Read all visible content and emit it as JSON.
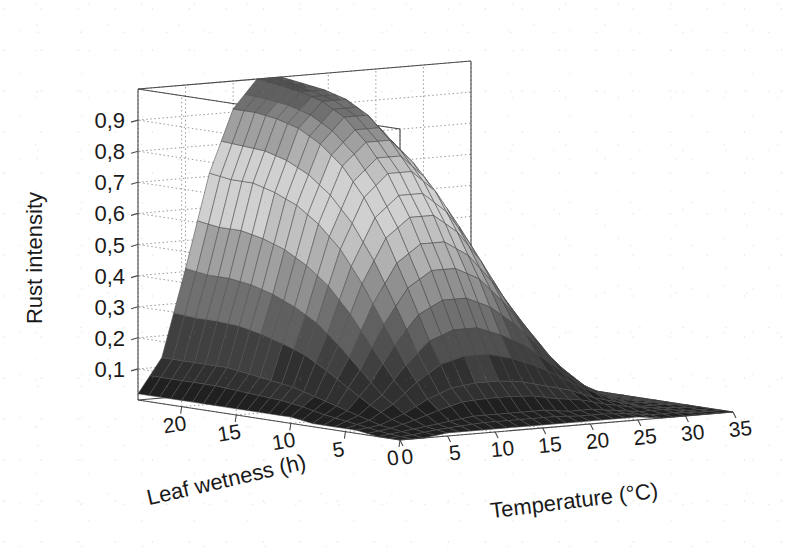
{
  "figure": {
    "kind": "3d-surface-plot",
    "background_color": "#ffffff",
    "grid_color": "#9a9a9a",
    "axis_line_color": "#4a4a4a",
    "mesh_edge_color": "#4c4c4c"
  },
  "axes": {
    "z": {
      "label": "Rust intensity",
      "ticks": [
        "0,1",
        "0,2",
        "0,3",
        "0,4",
        "0,5",
        "0,6",
        "0,7",
        "0,8",
        "0,9"
      ],
      "tick_values": [
        0.1,
        0.2,
        0.3,
        0.4,
        0.5,
        0.6,
        0.7,
        0.8,
        0.9
      ],
      "range": [
        0,
        1
      ],
      "decimal_separator": ","
    },
    "x": {
      "label": "Temperature (°C)",
      "ticks": [
        "0",
        "5",
        "10",
        "15",
        "20",
        "25",
        "30",
        "35"
      ],
      "tick_values": [
        0,
        5,
        10,
        15,
        20,
        25,
        30,
        35
      ],
      "range": [
        0,
        35
      ],
      "units": "°C"
    },
    "y": {
      "label": "Leaf wetness (h)",
      "ticks": [
        "0",
        "5",
        "10",
        "15",
        "20"
      ],
      "tick_values": [
        0,
        5,
        10,
        15,
        20
      ],
      "range": [
        0,
        24
      ],
      "units": "h"
    }
  },
  "chart_data": {
    "type": "heatmap",
    "render_as": "3d-surface",
    "title": "",
    "xlabel": "Temperature (°C)",
    "ylabel": "Leaf wetness (h)",
    "zlabel": "Rust intensity",
    "xlim": [
      0,
      35
    ],
    "ylim": [
      0,
      24
    ],
    "zlim": [
      0,
      1
    ],
    "grid": true,
    "legend": "none",
    "colormap": "grayscale",
    "x": [
      0,
      2.5,
      5,
      7.5,
      10,
      12.5,
      15,
      17.5,
      20,
      22.5,
      25,
      27.5,
      30,
      32.5,
      35
    ],
    "y": [
      0,
      2,
      4,
      6,
      8,
      10,
      12,
      14,
      16,
      18,
      20,
      22,
      24
    ],
    "z": [
      [
        0.0,
        0.0,
        0.01,
        0.01,
        0.01,
        0.01,
        0.01,
        0.01,
        0.01,
        0.01,
        0.01,
        0.0,
        0.0,
        0.0,
        0.0
      ],
      [
        0.0,
        0.01,
        0.02,
        0.03,
        0.04,
        0.04,
        0.04,
        0.04,
        0.03,
        0.03,
        0.02,
        0.01,
        0.01,
        0.0,
        0.0
      ],
      [
        0.01,
        0.02,
        0.05,
        0.09,
        0.12,
        0.13,
        0.13,
        0.12,
        0.1,
        0.08,
        0.05,
        0.03,
        0.01,
        0.01,
        0.0
      ],
      [
        0.01,
        0.04,
        0.1,
        0.19,
        0.26,
        0.29,
        0.29,
        0.26,
        0.22,
        0.16,
        0.1,
        0.05,
        0.02,
        0.01,
        0.0
      ],
      [
        0.01,
        0.06,
        0.17,
        0.31,
        0.42,
        0.47,
        0.47,
        0.43,
        0.35,
        0.26,
        0.16,
        0.08,
        0.03,
        0.01,
        0.0
      ],
      [
        0.02,
        0.08,
        0.24,
        0.43,
        0.57,
        0.63,
        0.63,
        0.57,
        0.47,
        0.34,
        0.21,
        0.1,
        0.04,
        0.01,
        0.0
      ],
      [
        0.02,
        0.1,
        0.3,
        0.53,
        0.69,
        0.76,
        0.76,
        0.69,
        0.57,
        0.41,
        0.26,
        0.12,
        0.05,
        0.01,
        0.0
      ],
      [
        0.02,
        0.11,
        0.34,
        0.6,
        0.78,
        0.85,
        0.85,
        0.77,
        0.64,
        0.46,
        0.29,
        0.14,
        0.05,
        0.02,
        0.0
      ],
      [
        0.02,
        0.12,
        0.37,
        0.65,
        0.84,
        0.92,
        0.92,
        0.83,
        0.69,
        0.5,
        0.31,
        0.15,
        0.06,
        0.02,
        0.0
      ],
      [
        0.02,
        0.13,
        0.39,
        0.68,
        0.88,
        0.96,
        0.96,
        0.87,
        0.72,
        0.52,
        0.33,
        0.16,
        0.06,
        0.02,
        0.0
      ],
      [
        0.02,
        0.13,
        0.4,
        0.7,
        0.9,
        0.98,
        0.98,
        0.89,
        0.74,
        0.54,
        0.34,
        0.16,
        0.06,
        0.02,
        0.0
      ],
      [
        0.02,
        0.13,
        0.4,
        0.7,
        0.91,
        0.99,
        0.99,
        0.9,
        0.75,
        0.54,
        0.34,
        0.16,
        0.06,
        0.02,
        0.0
      ],
      [
        0.02,
        0.13,
        0.41,
        0.71,
        0.91,
        1.0,
        1.0,
        0.9,
        0.75,
        0.55,
        0.34,
        0.17,
        0.06,
        0.02,
        0.0
      ]
    ],
    "peak": {
      "rust_intensity": 1.0,
      "temperature": 14,
      "leaf_wetness": 24
    }
  }
}
